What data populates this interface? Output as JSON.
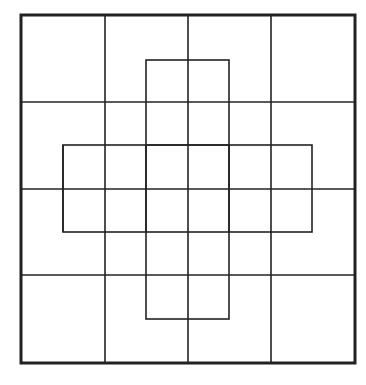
{
  "diagram": {
    "colors": {
      "background": "#ffffff",
      "stroke": "#222222"
    },
    "outer_square": {
      "x1": 21,
      "y1": 15,
      "x2": 355,
      "y2": 363,
      "stroke_width": 3
    },
    "grid_vertical_lines": [
      105,
      188,
      271
    ],
    "grid_horizontal_lines": [
      102,
      189,
      275
    ],
    "vertical_bar": {
      "x1": 146,
      "y1": 60,
      "x2": 229,
      "y2": 319
    },
    "horizontal_bar": {
      "x1": 63,
      "y1": 145,
      "x2": 312,
      "y2": 232
    }
  }
}
